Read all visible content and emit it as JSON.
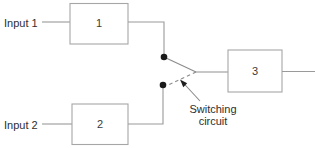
{
  "diagram": {
    "colors": {
      "background": "#ffffff",
      "wire": "#9a9a9a",
      "box_border": "#a6a6a6",
      "contact": "#1a1a1a",
      "text": "#2e2e2e"
    },
    "labels": {
      "input_1": "Input 1",
      "input_2": "Input 2",
      "switching_line_1": "Switching",
      "switching_line_2": "circuit"
    },
    "blocks": [
      {
        "id": "block-1",
        "label": "1"
      },
      {
        "id": "block-2",
        "label": "2"
      },
      {
        "id": "block-3",
        "label": "3"
      }
    ]
  }
}
